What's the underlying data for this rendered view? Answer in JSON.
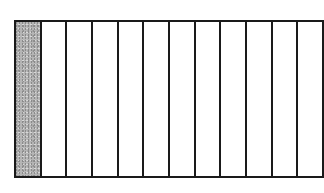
{
  "diagram": {
    "type": "fraction-bar",
    "total_parts": 12,
    "shaded_parts": 1,
    "shaded_indices": [
      0
    ],
    "colors": {
      "shaded": "#b5b5b5",
      "unshaded": "#ffffff",
      "border": "#1a1a1a"
    }
  }
}
